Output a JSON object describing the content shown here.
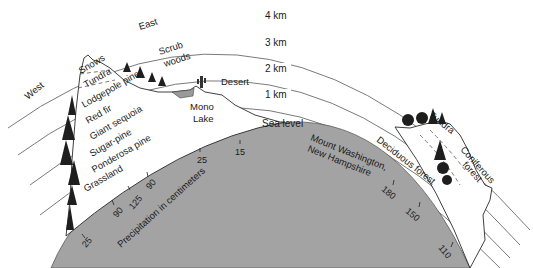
{
  "diagram": {
    "directions": {
      "west": "West",
      "east": "East"
    },
    "altitude_rings": [
      {
        "label": "4 km"
      },
      {
        "label": "3 km"
      },
      {
        "label": "2 km"
      },
      {
        "label": "1 km"
      },
      {
        "label": "Sea level"
      }
    ],
    "sierra_nevada": {
      "west_slope_zones": [
        "Snows",
        "Tundra",
        "Lodgepole pine",
        "Red fir",
        "Giant sequoia",
        "Sugar-pine",
        "Ponderosa pine",
        "Grassland"
      ],
      "east_slope_zones": [
        "Scrub woods",
        "Mono Lake",
        "Desert"
      ]
    },
    "mount_washington": {
      "label_line1": "Mount Washington,",
      "label_line2": "New Hampshire",
      "zones": [
        "Tundra",
        "Deciduous forest",
        "Coniferous forest"
      ],
      "coniferous_line1": "Coniferous",
      "coniferous_line2": "forest"
    },
    "precipitation": {
      "axis_label": "Precipitation in centimeters",
      "values_left": [
        "25",
        "90",
        "125",
        "90",
        "25",
        "15"
      ],
      "values_right": [
        "180",
        "150",
        "110"
      ]
    }
  }
}
